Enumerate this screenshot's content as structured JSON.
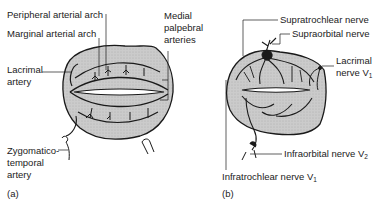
{
  "figure": {
    "panel_a": {
      "tag": "(a)",
      "labels": {
        "peripheral_arch": "Peripheral arterial arch",
        "marginal_arch": "Marginal arterial arch",
        "medial_palpebral_1": "Medial",
        "medial_palpebral_2": "palpebral",
        "medial_palpebral_3": "arteries",
        "lacrimal_artery_1": "Lacrimal",
        "lacrimal_artery_2": "artery",
        "zygomatico_1": "Zygomatico-",
        "zygomatico_2": "temporal",
        "zygomatico_3": "artery"
      }
    },
    "panel_b": {
      "tag": "(b)",
      "labels": {
        "supratrochlear": "Supratrochlear nerve",
        "supraorbital": "Supraorbital nerve",
        "lacrimal_nerve_1": "Lacrimal",
        "lacrimal_nerve_2": "nerve V",
        "lacrimal_nerve_sub": "1",
        "infraorbital": "Infraorbital nerve V",
        "infraorbital_sub": "2",
        "infratrochlear": "Infratrochlear  nerve V",
        "infratrochlear_sub": "1"
      }
    },
    "colors": {
      "fill": "#c9c9c9",
      "stroke": "#1a1a1a"
    }
  }
}
